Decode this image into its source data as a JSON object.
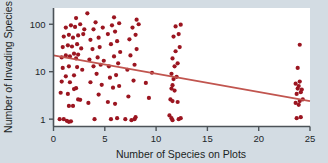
{
  "chart_data": {
    "type": "scatter",
    "title": "",
    "xlabel": "Number of Species on Plots",
    "ylabel": "Number of Invading Species",
    "xlim": [
      0,
      25
    ],
    "ylim": [
      0.7,
      220
    ],
    "yscale": "log",
    "xscale": "linear",
    "grid": false,
    "legend": null,
    "xticks": [
      0,
      5,
      10,
      15,
      20,
      25
    ],
    "xtick_labels": [
      "0",
      "5",
      "10",
      "15",
      "20",
      "25"
    ],
    "yticks": [
      1,
      10,
      100
    ],
    "ytick_labels": [
      "1",
      "10",
      "100"
    ],
    "marker_color": "#9b1520",
    "marker_size": 4.2,
    "trend_color": "#c1554f",
    "trendline": {
      "type": "linear-on-log-y",
      "x_start": 0,
      "y_start": 22,
      "x_end": 25,
      "y_end": 2.4
    },
    "points": [
      [
        0.6,
        1.0
      ],
      [
        1.0,
        1.0
      ],
      [
        1.3,
        0.92
      ],
      [
        1.5,
        0.88
      ],
      [
        1.7,
        0.9
      ],
      [
        1.5,
        1.9
      ],
      [
        1.9,
        1.9
      ],
      [
        2.4,
        2.6
      ],
      [
        2.6,
        2.55
      ],
      [
        0.7,
        3.6
      ],
      [
        1.4,
        3.4
      ],
      [
        2.0,
        4.3
      ],
      [
        2.2,
        4.5
      ],
      [
        0.8,
        6.2
      ],
      [
        1.6,
        6.0
      ],
      [
        1.2,
        8.0
      ],
      [
        2.0,
        8.4
      ],
      [
        0.9,
        12
      ],
      [
        1.5,
        13
      ],
      [
        2.3,
        12.5
      ],
      [
        2.8,
        11
      ],
      [
        0.8,
        20
      ],
      [
        1.2,
        22
      ],
      [
        1.6,
        21
      ],
      [
        2.0,
        24
      ],
      [
        2.4,
        23
      ],
      [
        2.2,
        19
      ],
      [
        0.9,
        33
      ],
      [
        1.4,
        36
      ],
      [
        1.8,
        34
      ],
      [
        2.3,
        38
      ],
      [
        2.7,
        31
      ],
      [
        1.0,
        55
      ],
      [
        1.5,
        60
      ],
      [
        1.9,
        52
      ],
      [
        2.4,
        58
      ],
      [
        2.9,
        62
      ],
      [
        1.2,
        85
      ],
      [
        1.7,
        95
      ],
      [
        2.1,
        88
      ],
      [
        2.6,
        100
      ],
      [
        3.0,
        78
      ],
      [
        2.2,
        135
      ],
      [
        3.3,
        170
      ],
      [
        3.4,
        2.2
      ],
      [
        4.0,
        1.0
      ],
      [
        4.4,
        3.3
      ],
      [
        4.7,
        5.3
      ],
      [
        3.6,
        6.0
      ],
      [
        4.2,
        9.0
      ],
      [
        3.9,
        13
      ],
      [
        4.6,
        14
      ],
      [
        3.5,
        18
      ],
      [
        4.3,
        20
      ],
      [
        4.9,
        17
      ],
      [
        3.8,
        30
      ],
      [
        4.5,
        33
      ],
      [
        3.6,
        47
      ],
      [
        4.4,
        52
      ],
      [
        3.9,
        78
      ],
      [
        4.8,
        85
      ],
      [
        4.1,
        110
      ],
      [
        5.6,
        1.0
      ],
      [
        6.2,
        1.05
      ],
      [
        5.3,
        2.3
      ],
      [
        6.0,
        2.1
      ],
      [
        5.8,
        4.6
      ],
      [
        6.4,
        5.0
      ],
      [
        5.5,
        7.5
      ],
      [
        6.1,
        8.5
      ],
      [
        5.4,
        13
      ],
      [
        6.3,
        15
      ],
      [
        5.9,
        21
      ],
      [
        6.5,
        26
      ],
      [
        5.6,
        38
      ],
      [
        6.2,
        44
      ],
      [
        5.3,
        62
      ],
      [
        6.0,
        70
      ],
      [
        5.7,
        95
      ],
      [
        6.4,
        105
      ],
      [
        5.9,
        140
      ],
      [
        7.0,
        1.0
      ],
      [
        7.6,
        0.95
      ],
      [
        7.9,
        1.0
      ],
      [
        8.0,
        1.1
      ],
      [
        7.3,
        3.0
      ],
      [
        7.8,
        6.5
      ],
      [
        7.2,
        11
      ],
      [
        7.9,
        14
      ],
      [
        7.5,
        22
      ],
      [
        8.1,
        30
      ],
      [
        7.4,
        48
      ],
      [
        8.0,
        60
      ],
      [
        7.7,
        85
      ],
      [
        8.3,
        100
      ],
      [
        8.1,
        125
      ],
      [
        9.0,
        5.8
      ],
      [
        9.3,
        2.8
      ],
      [
        9.6,
        9.5
      ],
      [
        11.3,
        1.2
      ],
      [
        11.5,
        1.05
      ],
      [
        11.6,
        0.95
      ],
      [
        12.2,
        1.0
      ],
      [
        12.4,
        1.05
      ],
      [
        11.4,
        2.6
      ],
      [
        11.6,
        2.4
      ],
      [
        12.1,
        2.3
      ],
      [
        11.5,
        4.4
      ],
      [
        11.8,
        4.0
      ],
      [
        11.6,
        5.2
      ],
      [
        11.7,
        7.0
      ],
      [
        12.0,
        7.8
      ],
      [
        11.5,
        9.0
      ],
      [
        11.8,
        13
      ],
      [
        12.1,
        15
      ],
      [
        11.6,
        19
      ],
      [
        11.9,
        27
      ],
      [
        12.3,
        33
      ],
      [
        11.7,
        55
      ],
      [
        12.2,
        62
      ],
      [
        11.9,
        90
      ],
      [
        12.4,
        98
      ],
      [
        23.7,
        1.05
      ],
      [
        24.1,
        1.1
      ],
      [
        23.6,
        2.2
      ],
      [
        24.0,
        2.4
      ],
      [
        23.9,
        2.0
      ],
      [
        24.3,
        2.6
      ],
      [
        23.7,
        3.4
      ],
      [
        24.1,
        3.7
      ],
      [
        23.8,
        4.4
      ],
      [
        24.2,
        4.2
      ],
      [
        23.6,
        5.6
      ],
      [
        24.0,
        6.2
      ],
      [
        23.9,
        5.0
      ],
      [
        23.8,
        12
      ],
      [
        24.0,
        37
      ]
    ]
  }
}
